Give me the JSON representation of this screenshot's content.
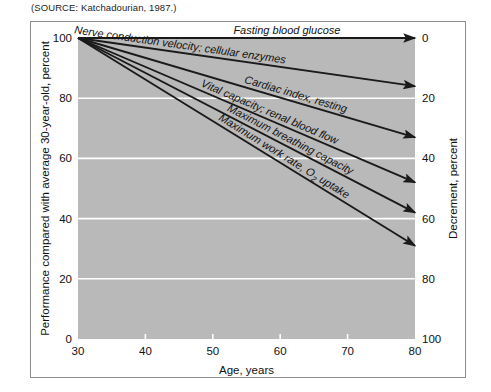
{
  "source": {
    "prefix": "(",
    "label": "SOURCE",
    "text": ": Katchadourian, 1987.)",
    "full": "(SOURCE: Katchadourian, 1987.)"
  },
  "colors": {
    "plot_background": "#b9b9b9",
    "gridline": "#ffffff",
    "line": "#1a1a1a",
    "frame": "#8c8c8c",
    "text": "#111111",
    "page_background": "#ffffff"
  },
  "chart_data": {
    "type": "line",
    "title": "",
    "xlabel": "Age, years",
    "ylabel": "Performance compared with average 30-year-old, percent",
    "y2label": "Decrement, percent",
    "xlim": [
      30,
      80
    ],
    "ylim": [
      0,
      100
    ],
    "y2lim": [
      0,
      100
    ],
    "xticks": [
      30,
      40,
      50,
      60,
      70,
      80
    ],
    "xticklabels": [
      "30",
      "40",
      "50",
      "60",
      "70",
      "80"
    ],
    "yticks": [
      0,
      20,
      40,
      60,
      80,
      100
    ],
    "yticklabels": [
      "0",
      "20",
      "40",
      "60",
      "80",
      "100"
    ],
    "y2ticks": [
      0,
      20,
      40,
      60,
      80,
      100
    ],
    "y2ticklabels": [
      "0",
      "20",
      "40",
      "60",
      "80",
      "100"
    ],
    "y2_inverted": true,
    "grid": true,
    "grid_axis": "y",
    "legend": "inline-labels",
    "x": [
      30,
      80
    ],
    "series": [
      {
        "name": "Fasting blood glucose",
        "label": "Fasting blood glucose",
        "values": [
          100,
          100
        ],
        "decrement_at_80": 0
      },
      {
        "name": "Nerve conduction velocity; cellular enzymes",
        "label": "Nerve conduction velocity; cellular enzymes",
        "values": [
          100,
          84
        ],
        "decrement_at_80": 16
      },
      {
        "name": "Cardiac index, resting",
        "label": "Cardiac index, resting",
        "values": [
          100,
          67
        ],
        "decrement_at_80": 33
      },
      {
        "name": "Vital capacity; renal blood flow",
        "label": "Vital capacity; renal blood flow",
        "values": [
          100,
          52
        ],
        "decrement_at_80": 48
      },
      {
        "name": "Maximum breathing capacity",
        "label": "Maximum breathing capacity",
        "values": [
          100,
          42
        ],
        "decrement_at_80": 58
      },
      {
        "name": "Maximum work rate, O2 uptake",
        "label": "Maximum work rate, O",
        "label_sub": "2",
        "label_tail": " uptake",
        "values": [
          100,
          31
        ],
        "decrement_at_80": 69
      }
    ]
  }
}
